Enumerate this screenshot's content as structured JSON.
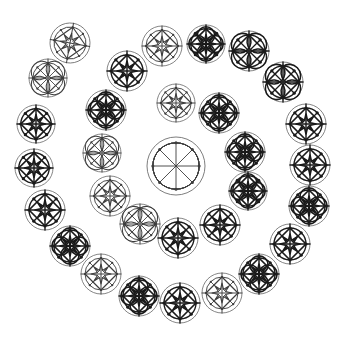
{
  "figure": {
    "background_color": "#ffffff",
    "width": 345,
    "height": 340,
    "ink_color": "#1a1a1a",
    "light_ink_color": "#6f6f6f",
    "mid_ink_color": "#3d3d3d"
  },
  "chart_data": {
    "type": "scatter",
    "subtitle": "",
    "xlabel": "",
    "ylabel": "",
    "xlim": [
      0,
      345
    ],
    "ylim": [
      0,
      340
    ],
    "grid": false,
    "legend": null,
    "center_motif": {
      "name": "central-rosette",
      "cx": 176,
      "cy": 166,
      "r": 29,
      "variant": "petal",
      "weight": "light",
      "spokes": 8,
      "has_square": false,
      "has_petals": true,
      "has_nodes": true
    },
    "motifs": [
      {
        "id": 1,
        "cx": 70,
        "cy": 43,
        "r": 20,
        "variant": "star",
        "weight": "mid",
        "rot": 10
      },
      {
        "id": 2,
        "cx": 162,
        "cy": 46,
        "r": 20,
        "variant": "star",
        "weight": "mid",
        "rot": 0
      },
      {
        "id": 3,
        "cx": 206,
        "cy": 44,
        "r": 19,
        "variant": "bold",
        "weight": "bold",
        "rot": 0
      },
      {
        "id": 4,
        "cx": 249,
        "cy": 51,
        "r": 20,
        "variant": "petal",
        "weight": "bold",
        "rot": 0
      },
      {
        "id": 5,
        "cx": 48,
        "cy": 78,
        "r": 19,
        "variant": "petal",
        "weight": "mid",
        "rot": 0
      },
      {
        "id": 6,
        "cx": 127,
        "cy": 71,
        "r": 20,
        "variant": "star",
        "weight": "bold",
        "rot": 0
      },
      {
        "id": 7,
        "cx": 283,
        "cy": 82,
        "r": 20,
        "variant": "petal",
        "weight": "bold",
        "rot": 0
      },
      {
        "id": 8,
        "cx": 36,
        "cy": 124,
        "r": 19,
        "variant": "star",
        "weight": "bold",
        "rot": 0
      },
      {
        "id": 9,
        "cx": 106,
        "cy": 110,
        "r": 20,
        "variant": "bold",
        "weight": "bold",
        "rot": 0
      },
      {
        "id": 10,
        "cx": 176,
        "cy": 103,
        "r": 19,
        "variant": "star",
        "weight": "mid",
        "rot": 0
      },
      {
        "id": 11,
        "cx": 219,
        "cy": 113,
        "r": 20,
        "variant": "bold",
        "weight": "bold",
        "rot": 0
      },
      {
        "id": 12,
        "cx": 306,
        "cy": 124,
        "r": 20,
        "variant": "star",
        "weight": "bold",
        "rot": 0
      },
      {
        "id": 13,
        "cx": 34,
        "cy": 168,
        "r": 19,
        "variant": "star",
        "weight": "bold",
        "rot": 0
      },
      {
        "id": 14,
        "cx": 102,
        "cy": 153,
        "r": 19,
        "variant": "petal",
        "weight": "mid",
        "rot": 0
      },
      {
        "id": 15,
        "cx": 245,
        "cy": 152,
        "r": 20,
        "variant": "bold",
        "weight": "bold",
        "rot": 0
      },
      {
        "id": 16,
        "cx": 310,
        "cy": 165,
        "r": 20,
        "variant": "star",
        "weight": "bold",
        "rot": 0
      },
      {
        "id": 17,
        "cx": 45,
        "cy": 210,
        "r": 20,
        "variant": "star",
        "weight": "bold",
        "rot": 0
      },
      {
        "id": 18,
        "cx": 110,
        "cy": 196,
        "r": 20,
        "variant": "star",
        "weight": "mid",
        "rot": 0
      },
      {
        "id": 19,
        "cx": 248,
        "cy": 191,
        "r": 19,
        "variant": "bold",
        "weight": "bold",
        "rot": 0
      },
      {
        "id": 20,
        "cx": 309,
        "cy": 206,
        "r": 20,
        "variant": "bold",
        "weight": "bold",
        "rot": 0
      },
      {
        "id": 21,
        "cx": 70,
        "cy": 246,
        "r": 20,
        "variant": "bold",
        "weight": "bold",
        "rot": 0
      },
      {
        "id": 22,
        "cx": 140,
        "cy": 224,
        "r": 20,
        "variant": "petal",
        "weight": "mid",
        "rot": 0
      },
      {
        "id": 23,
        "cx": 178,
        "cy": 238,
        "r": 20,
        "variant": "star",
        "weight": "bold",
        "rot": 0
      },
      {
        "id": 24,
        "cx": 220,
        "cy": 225,
        "r": 20,
        "variant": "star",
        "weight": "bold",
        "rot": 0
      },
      {
        "id": 25,
        "cx": 290,
        "cy": 244,
        "r": 20,
        "variant": "star",
        "weight": "bold",
        "rot": 0
      },
      {
        "id": 26,
        "cx": 101,
        "cy": 274,
        "r": 20,
        "variant": "star",
        "weight": "mid",
        "rot": 0
      },
      {
        "id": 27,
        "cx": 259,
        "cy": 274,
        "r": 20,
        "variant": "bold",
        "weight": "bold",
        "rot": 0
      },
      {
        "id": 28,
        "cx": 139,
        "cy": 296,
        "r": 20,
        "variant": "bold",
        "weight": "bold",
        "rot": 0
      },
      {
        "id": 29,
        "cx": 180,
        "cy": 303,
        "r": 20,
        "variant": "star",
        "weight": "bold",
        "rot": 0
      },
      {
        "id": 30,
        "cx": 222,
        "cy": 293,
        "r": 20,
        "variant": "star",
        "weight": "mid",
        "rot": 0
      }
    ]
  }
}
